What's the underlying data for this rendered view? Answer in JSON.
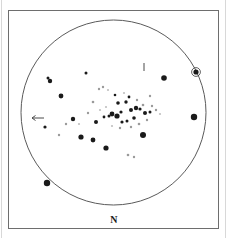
{
  "figure": {
    "kind": "astronomical-finder-chart",
    "north_label": "N",
    "background_color": "#ffffff",
    "ink_color": "#1a1a1a",
    "frame": {
      "x": 8,
      "y": 10,
      "width": 210,
      "height": 218
    },
    "field_circle": {
      "cx": 113.5,
      "cy": 112.5,
      "r": 92.5
    }
  },
  "chart_data": {
    "type": "scatter",
    "title": "",
    "subtitle": "",
    "xlabel": "",
    "ylabel": "",
    "xlim": [
      21,
      206
    ],
    "ylim": [
      20,
      205
    ],
    "grid": false,
    "legend": null,
    "orientation_labels": [
      {
        "text": "N",
        "x": 113,
        "y": 221,
        "position": "bottom-center"
      }
    ],
    "annotations": [
      {
        "name": "left-arrow-marker",
        "type": "arrow",
        "direction": "left",
        "x": 32,
        "y": 118,
        "length": 12
      },
      {
        "name": "top-tick-marker",
        "type": "tick",
        "direction": "vertical",
        "x": 144,
        "y": 63,
        "length": 8
      }
    ],
    "series": [
      {
        "name": "stars",
        "marker": "filled-circle",
        "points": [
          {
            "x": 196,
            "y": 72,
            "r": 2.6,
            "tone": "dark",
            "ringed": true
          },
          {
            "x": 194,
            "y": 117,
            "r": 3.2,
            "tone": "dark",
            "ringed": false
          },
          {
            "x": 47,
            "y": 183,
            "r": 3.2,
            "tone": "dark",
            "ringed": false
          },
          {
            "x": 164,
            "y": 78,
            "r": 2.8,
            "tone": "dark",
            "ringed": false
          },
          {
            "x": 48,
            "y": 78,
            "r": 1.5,
            "tone": "dark",
            "ringed": false
          },
          {
            "x": 50,
            "y": 81,
            "r": 2.2,
            "tone": "dark",
            "ringed": false
          },
          {
            "x": 86,
            "y": 73,
            "r": 1.5,
            "tone": "dark",
            "ringed": false
          },
          {
            "x": 61,
            "y": 96,
            "r": 2.4,
            "tone": "dark",
            "ringed": false
          },
          {
            "x": 45,
            "y": 127,
            "r": 1.6,
            "tone": "dark",
            "ringed": false
          },
          {
            "x": 73,
            "y": 119,
            "r": 2.2,
            "tone": "dark",
            "ringed": false
          },
          {
            "x": 96,
            "y": 122,
            "r": 2.0,
            "tone": "dark",
            "ringed": false
          },
          {
            "x": 81,
            "y": 137,
            "r": 2.6,
            "tone": "dark",
            "ringed": false
          },
          {
            "x": 93,
            "y": 140,
            "r": 2.4,
            "tone": "dark",
            "ringed": false
          },
          {
            "x": 106,
            "y": 148,
            "r": 2.6,
            "tone": "dark",
            "ringed": false
          },
          {
            "x": 143,
            "y": 135,
            "r": 3.0,
            "tone": "dark",
            "ringed": false
          },
          {
            "x": 118,
            "y": 103,
            "r": 1.8,
            "tone": "dark",
            "ringed": false
          },
          {
            "x": 126,
            "y": 102,
            "r": 1.7,
            "tone": "dark",
            "ringed": false
          },
          {
            "x": 112,
            "y": 114,
            "r": 2.4,
            "tone": "dark",
            "ringed": false
          },
          {
            "x": 117,
            "y": 116,
            "r": 2.6,
            "tone": "dark",
            "ringed": false
          },
          {
            "x": 121,
            "y": 112,
            "r": 1.6,
            "tone": "dark",
            "ringed": false
          },
          {
            "x": 131,
            "y": 110,
            "r": 2.0,
            "tone": "dark",
            "ringed": false
          },
          {
            "x": 136,
            "y": 108,
            "r": 2.2,
            "tone": "dark",
            "ringed": false
          },
          {
            "x": 140,
            "y": 109,
            "r": 1.6,
            "tone": "dark",
            "ringed": false
          },
          {
            "x": 145,
            "y": 113,
            "r": 2.0,
            "tone": "dark",
            "ringed": false
          },
          {
            "x": 150,
            "y": 112,
            "r": 1.5,
            "tone": "dark",
            "ringed": false
          },
          {
            "x": 134,
            "y": 118,
            "r": 1.8,
            "tone": "dark",
            "ringed": false
          },
          {
            "x": 127,
            "y": 121,
            "r": 1.5,
            "tone": "dark",
            "ringed": false
          },
          {
            "x": 122,
            "y": 122,
            "r": 1.6,
            "tone": "dark",
            "ringed": false
          },
          {
            "x": 109,
            "y": 116,
            "r": 1.5,
            "tone": "dark",
            "ringed": false
          },
          {
            "x": 104,
            "y": 117,
            "r": 1.4,
            "tone": "dark",
            "ringed": false
          },
          {
            "x": 115,
            "y": 95,
            "r": 1.3,
            "tone": "dark",
            "ringed": false
          },
          {
            "x": 129,
            "y": 97,
            "r": 1.4,
            "tone": "dark",
            "ringed": false
          },
          {
            "x": 93,
            "y": 102,
            "r": 1.3,
            "tone": "faint",
            "ringed": false
          },
          {
            "x": 99,
            "y": 89,
            "r": 1.2,
            "tone": "faint",
            "ringed": false
          },
          {
            "x": 103,
            "y": 87,
            "r": 1.2,
            "tone": "faint",
            "ringed": false
          },
          {
            "x": 108,
            "y": 90,
            "r": 1.1,
            "tone": "vfaint",
            "ringed": false
          },
          {
            "x": 137,
            "y": 100,
            "r": 1.2,
            "tone": "faint",
            "ringed": false
          },
          {
            "x": 143,
            "y": 105,
            "r": 1.3,
            "tone": "faint",
            "ringed": false
          },
          {
            "x": 152,
            "y": 106,
            "r": 1.2,
            "tone": "faint",
            "ringed": false
          },
          {
            "x": 156,
            "y": 110,
            "r": 1.2,
            "tone": "faint",
            "ringed": false
          },
          {
            "x": 160,
            "y": 114,
            "r": 1.1,
            "tone": "vfaint",
            "ringed": false
          },
          {
            "x": 147,
            "y": 120,
            "r": 1.2,
            "tone": "faint",
            "ringed": false
          },
          {
            "x": 139,
            "y": 124,
            "r": 1.3,
            "tone": "faint",
            "ringed": false
          },
          {
            "x": 131,
            "y": 127,
            "r": 1.2,
            "tone": "faint",
            "ringed": false
          },
          {
            "x": 120,
            "y": 128,
            "r": 1.2,
            "tone": "faint",
            "ringed": false
          },
          {
            "x": 112,
            "y": 126,
            "r": 1.1,
            "tone": "vfaint",
            "ringed": false
          },
          {
            "x": 106,
            "y": 107,
            "r": 1.1,
            "tone": "vfaint",
            "ringed": false
          },
          {
            "x": 100,
            "y": 110,
            "r": 1.1,
            "tone": "vfaint",
            "ringed": false
          },
          {
            "x": 88,
            "y": 113,
            "r": 1.2,
            "tone": "faint",
            "ringed": false
          },
          {
            "x": 66,
            "y": 124,
            "r": 1.2,
            "tone": "faint",
            "ringed": false
          },
          {
            "x": 59,
            "y": 135,
            "r": 1.2,
            "tone": "faint",
            "ringed": false
          },
          {
            "x": 79,
            "y": 124,
            "r": 1.1,
            "tone": "vfaint",
            "ringed": false
          },
          {
            "x": 128,
            "y": 155,
            "r": 1.3,
            "tone": "faint",
            "ringed": false
          },
          {
            "x": 134,
            "y": 157,
            "r": 1.2,
            "tone": "faint",
            "ringed": false
          },
          {
            "x": 150,
            "y": 96,
            "r": 1.2,
            "tone": "faint",
            "ringed": false
          },
          {
            "x": 124,
            "y": 93,
            "r": 1.1,
            "tone": "vfaint",
            "ringed": false
          }
        ]
      }
    ]
  }
}
